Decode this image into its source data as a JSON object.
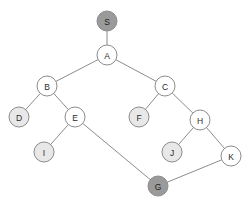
{
  "diagram": {
    "type": "node-link-graph",
    "node_radius": 10,
    "colors": {
      "edge": "#8c8c8c",
      "node_stroke": "#8c8c8c",
      "node_fill_default": "#ffffff",
      "node_fill_leaf": "#e8e8e8",
      "node_fill_highlight": "#9a9a9a",
      "label_text": "#2b2b2b",
      "background": "#ffffff"
    },
    "nodes": [
      {
        "id": "S",
        "label": "S",
        "x": 107,
        "y": 21,
        "fill": "#9a9a9a",
        "state": "highlight"
      },
      {
        "id": "A",
        "label": "A",
        "x": 107,
        "y": 55,
        "fill": "#ffffff",
        "state": "default"
      },
      {
        "id": "B",
        "label": "B",
        "x": 47,
        "y": 86,
        "fill": "#ffffff",
        "state": "default"
      },
      {
        "id": "C",
        "label": "C",
        "x": 165,
        "y": 86,
        "fill": "#ffffff",
        "state": "default"
      },
      {
        "id": "D",
        "label": "D",
        "x": 19,
        "y": 117,
        "fill": "#e8e8e8",
        "state": "leaf"
      },
      {
        "id": "E",
        "label": "E",
        "x": 75,
        "y": 117,
        "fill": "#ffffff",
        "state": "default"
      },
      {
        "id": "F",
        "label": "F",
        "x": 139,
        "y": 117,
        "fill": "#e8e8e8",
        "state": "leaf"
      },
      {
        "id": "H",
        "label": "H",
        "x": 200,
        "y": 120,
        "fill": "#ffffff",
        "state": "default"
      },
      {
        "id": "I",
        "label": "I",
        "x": 44,
        "y": 152,
        "fill": "#e8e8e8",
        "state": "leaf"
      },
      {
        "id": "J",
        "label": "J",
        "x": 172,
        "y": 152,
        "fill": "#e8e8e8",
        "state": "leaf"
      },
      {
        "id": "K",
        "label": "K",
        "x": 231,
        "y": 156,
        "fill": "#ffffff",
        "state": "default"
      },
      {
        "id": "G",
        "label": "G",
        "x": 158,
        "y": 186,
        "fill": "#9a9a9a",
        "state": "highlight"
      }
    ],
    "edges": [
      {
        "from": "S",
        "to": "A"
      },
      {
        "from": "A",
        "to": "B"
      },
      {
        "from": "A",
        "to": "C"
      },
      {
        "from": "B",
        "to": "D"
      },
      {
        "from": "B",
        "to": "E"
      },
      {
        "from": "C",
        "to": "F"
      },
      {
        "from": "C",
        "to": "H"
      },
      {
        "from": "E",
        "to": "I"
      },
      {
        "from": "E",
        "to": "G"
      },
      {
        "from": "H",
        "to": "J"
      },
      {
        "from": "H",
        "to": "K"
      },
      {
        "from": "K",
        "to": "G"
      }
    ]
  }
}
